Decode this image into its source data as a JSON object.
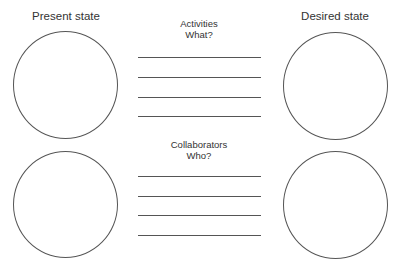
{
  "headings": {
    "present": "Present state",
    "desired": "Desired state"
  },
  "sections": [
    {
      "title": "Activities",
      "question": "What?",
      "line_count": 4
    },
    {
      "title": "Collaborators",
      "question": "Who?",
      "line_count": 4
    }
  ],
  "colors": {
    "stroke": "#555555",
    "text": "#333333",
    "background": "#ffffff"
  }
}
